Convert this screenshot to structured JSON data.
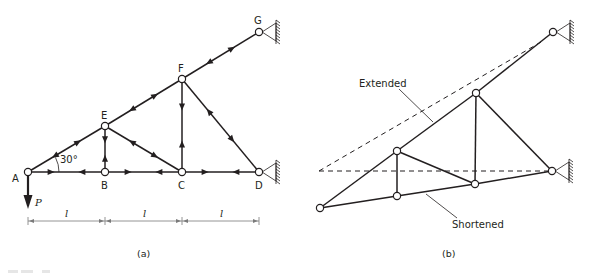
{
  "figure": {
    "panel_a": {
      "caption": "(a)",
      "joints": [
        "A",
        "B",
        "C",
        "D",
        "E",
        "F",
        "G"
      ],
      "angle_label": "30°",
      "load_label": "P",
      "span_labels": [
        "l",
        "l",
        "l"
      ],
      "supports": [
        "G",
        "D"
      ]
    },
    "panel_b": {
      "caption": "(b)",
      "extended_label": "Extended",
      "shortened_label": "Shortened"
    },
    "colors": {
      "ink": "#231f20",
      "background": "#ffffff"
    }
  }
}
